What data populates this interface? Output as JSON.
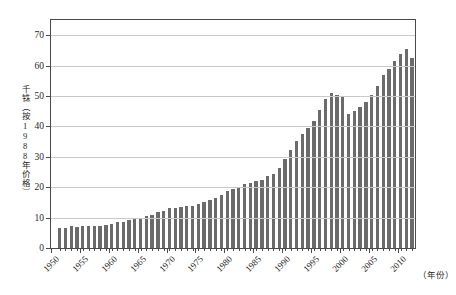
{
  "chart_data": {
    "type": "bar",
    "title": "",
    "subtitle": "",
    "xlabel": "（年份）",
    "ylabel": "千铢（按1988年价格）",
    "ylim": [
      0,
      75
    ],
    "xlim": [
      1950.0,
      2013.0
    ],
    "ytick_labels": [
      "0",
      "10",
      "20",
      "30",
      "40",
      "50",
      "60",
      "70"
    ],
    "ytick_values": [
      0,
      10,
      20,
      30,
      40,
      50,
      60,
      70
    ],
    "xtick_labels": [
      "1950",
      "1955",
      "1960",
      "1965",
      "1970",
      "1975",
      "1980",
      "1985",
      "1990",
      "1995",
      "2000",
      "2005",
      "2010"
    ],
    "xtick_values": [
      1950,
      1955,
      1960,
      1965,
      1970,
      1975,
      1980,
      1985,
      1990,
      1995,
      2000,
      2005,
      2010
    ],
    "grid": "horizontal",
    "legend": "none",
    "bar_color": "#6b6b6b",
    "grid_color": "#c9c9c9",
    "axis_color": "#4a4a4a",
    "categories": [
      1951,
      1952,
      1953,
      1954,
      1955,
      1956,
      1957,
      1958,
      1959,
      1960,
      1961,
      1962,
      1963,
      1964,
      1965,
      1966,
      1967,
      1968,
      1969,
      1970,
      1971,
      1972,
      1973,
      1974,
      1975,
      1976,
      1977,
      1978,
      1979,
      1980,
      1981,
      1982,
      1983,
      1984,
      1985,
      1986,
      1987,
      1988,
      1989,
      1990,
      1991,
      1992,
      1993,
      1994,
      1995,
      1996,
      1997,
      1998,
      1999,
      2000,
      2001,
      2002,
      2003,
      2004,
      2005,
      2006,
      2007,
      2008,
      2009,
      2010,
      2011,
      2012
    ],
    "values": [
      6.6,
      6.5,
      7.1,
      6.8,
      7.2,
      7.2,
      7.2,
      7.2,
      7.5,
      7.8,
      8.6,
      8.7,
      9.1,
      9.5,
      9.9,
      10.6,
      11.0,
      11.8,
      12.3,
      13.0,
      13.3,
      13.6,
      13.9,
      13.9,
      14.5,
      15.2,
      15.8,
      16.3,
      17.4,
      18.8,
      19.5,
      20.2,
      20.9,
      21.5,
      22.1,
      22.4,
      23.6,
      24.5,
      26.3,
      29.2,
      32.4,
      35.2,
      37.4,
      39.5,
      41.8,
      45.3,
      49.0,
      51.1,
      50.2,
      50.0,
      44.0,
      45.1,
      46.4,
      48.1,
      50.4,
      53.4,
      56.8,
      58.9,
      61.4,
      63.8,
      65.4,
      62.5
    ]
  }
}
